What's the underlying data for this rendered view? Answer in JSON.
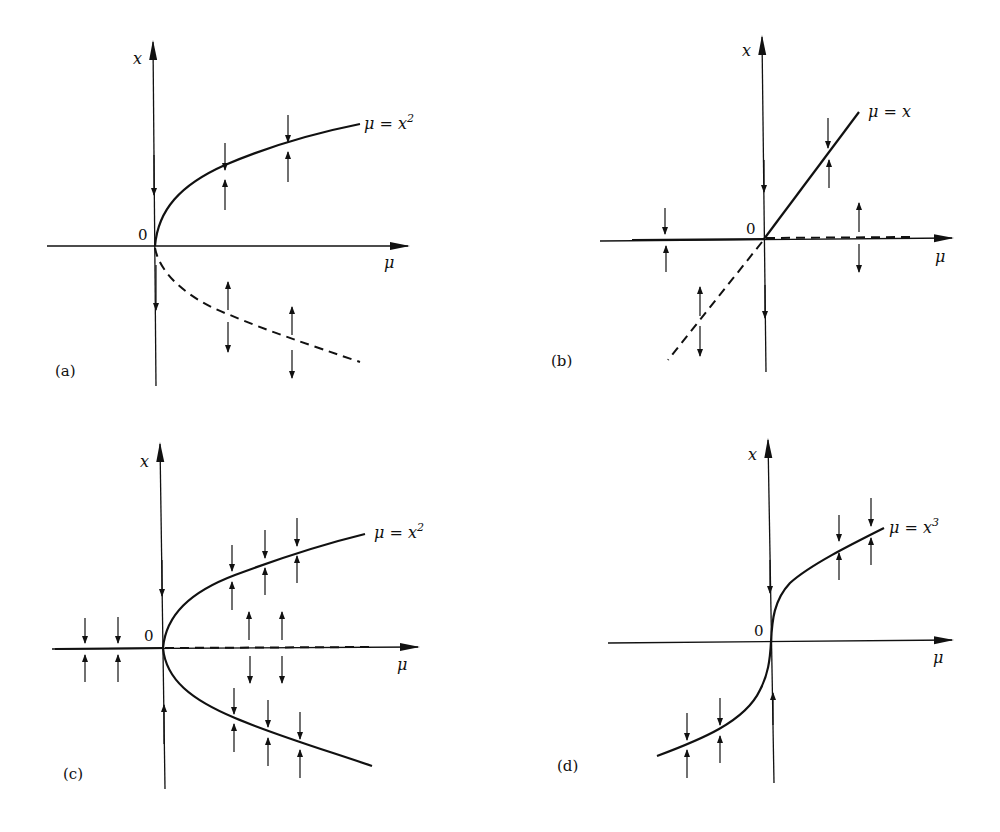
{
  "figure": {
    "panels": [
      {
        "id": "a",
        "caption": "(a)",
        "type": "saddle-node",
        "origin_label": "0",
        "x_axis_label": "μ",
        "y_axis_label": "x",
        "curve_label": "μ = x",
        "curve_label_exp": "2",
        "branches": [
          {
            "equation": "x = +√μ",
            "style": "solid",
            "stability": "stable"
          },
          {
            "equation": "x = −√μ",
            "style": "dashed",
            "stability": "unstable"
          }
        ]
      },
      {
        "id": "b",
        "caption": "(b)",
        "type": "transcritical",
        "origin_label": "0",
        "x_axis_label": "μ",
        "y_axis_label": "x",
        "curve_label": "μ = x",
        "curve_label_exp": "",
        "branches": [
          {
            "equation": "x = 0, μ<0",
            "style": "solid",
            "stability": "stable"
          },
          {
            "equation": "x = 0, μ>0",
            "style": "dashed",
            "stability": "unstable"
          },
          {
            "equation": "x = μ, μ>0",
            "style": "solid",
            "stability": "stable"
          },
          {
            "equation": "x = μ, μ<0",
            "style": "dashed",
            "stability": "unstable"
          }
        ]
      },
      {
        "id": "c",
        "caption": "(c)",
        "type": "supercritical-pitchfork",
        "origin_label": "0",
        "x_axis_label": "μ",
        "y_axis_label": "x",
        "curve_label": "μ = x",
        "curve_label_exp": "2",
        "branches": [
          {
            "equation": "x = 0, μ<0",
            "style": "solid",
            "stability": "stable"
          },
          {
            "equation": "x = 0, μ>0",
            "style": "dashed",
            "stability": "unstable"
          },
          {
            "equation": "x = ±√μ",
            "style": "solid",
            "stability": "stable"
          }
        ]
      },
      {
        "id": "d",
        "caption": "(d)",
        "type": "no-bifurcation",
        "origin_label": "0",
        "x_axis_label": "μ",
        "y_axis_label": "x",
        "curve_label": "μ = x",
        "curve_label_exp": "3",
        "branches": [
          {
            "equation": "x = ∛μ",
            "style": "solid",
            "stability": "stable"
          }
        ]
      }
    ]
  }
}
